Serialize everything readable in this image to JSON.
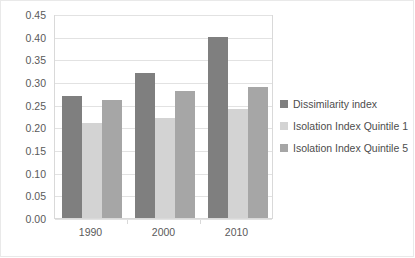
{
  "chart_data": {
    "type": "bar",
    "title": "",
    "xlabel": "",
    "ylabel": "",
    "categories": [
      "1990",
      "2000",
      "2010"
    ],
    "series": [
      {
        "name": "Dissimilarity index",
        "color": "#7f7f7f",
        "values": [
          0.27,
          0.32,
          0.4
        ]
      },
      {
        "name": "Isolation Index Quintile 1",
        "color": "#d3d3d3",
        "values": [
          0.21,
          0.22,
          0.24
        ]
      },
      {
        "name": "Isolation Index Quintile 5",
        "color": "#a6a6a6",
        "values": [
          0.26,
          0.28,
          0.29
        ]
      }
    ],
    "ylim": [
      0.0,
      0.45
    ],
    "ytick_labels": [
      "0.00",
      "0.05",
      "0.10",
      "0.15",
      "0.20",
      "0.25",
      "0.30",
      "0.35",
      "0.40",
      "0.45"
    ],
    "ytick_values": [
      0.0,
      0.05,
      0.1,
      0.15,
      0.2,
      0.25,
      0.3,
      0.35,
      0.4,
      0.45
    ],
    "grid": true,
    "legend_position": "right"
  }
}
